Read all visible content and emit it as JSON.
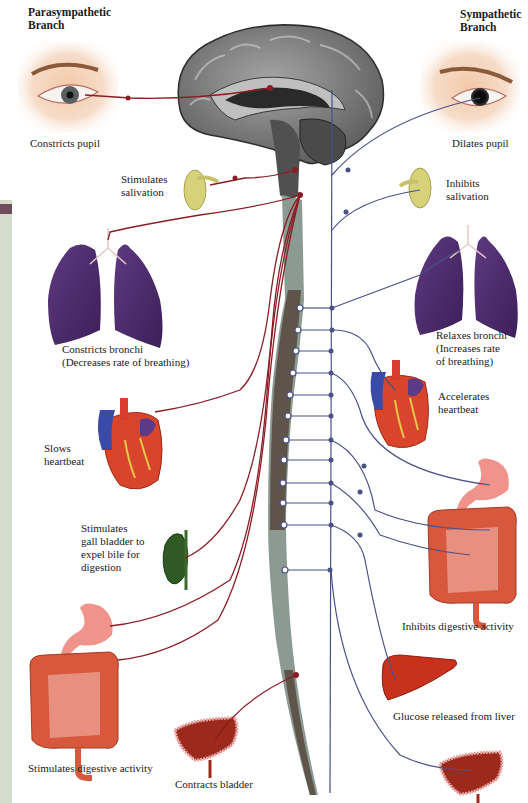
{
  "headings": {
    "parasympathetic": "Parasympathetic\nBranch",
    "sympathetic": "Sympathetic\nBranch"
  },
  "parasympathetic_effects": {
    "eye": "Constricts pupil",
    "salivary": "Stimulates\nsalivation",
    "lungs": "Constricts bronchi\n(Decreases rate of breathing)",
    "heart": "Slows\nheartbeat",
    "gallbladder": "Stimulates\ngall bladder to\nexpel bile for\ndigestion",
    "digestive": "Stimulates digestive activity",
    "bladder": "Contracts bladder"
  },
  "sympathetic_effects": {
    "eye": "Dilates pupil",
    "salivary": "Inhibits\nsalivation",
    "lungs": "Relaxes bronchi\n(Increases rate\nof breathing)",
    "heart": "Accelerates\nheartbeat",
    "digestive": "Inhibits digestive activity",
    "liver": "Glucose released from liver",
    "bladder": "Relaxes bladder"
  },
  "colors": {
    "parasympathetic_nerve": "#8b1c24",
    "sympathetic_nerve": "#4a5188",
    "brain_gray": "#7a7a7a",
    "spinal_cord_gray": "#8c9a94",
    "spinal_cord_dark": "#5e544a",
    "lung_purple": "#4e2a6e",
    "organ_red": "#d8452c",
    "gland_yellow": "#d7d27a"
  }
}
